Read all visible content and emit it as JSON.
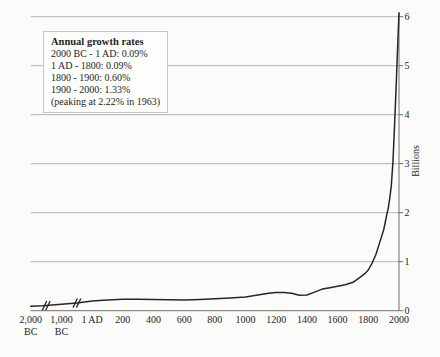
{
  "legend": {
    "title": "Annual growth rates",
    "lines": [
      "2000 BC - 1 AD: 0.09%",
      "1 AD - 1800: 0.09%",
      "1800 - 1900: 0.60%",
      "1900 - 2000: 1.33%",
      "(peaking at 2.22% in 1963)"
    ]
  },
  "chart_data": {
    "type": "line",
    "title": "",
    "xlabel": "",
    "ylabel": "Billions",
    "ylim": [
      0,
      6
    ],
    "y_ticks": [
      0,
      1,
      2,
      3,
      4,
      5,
      6
    ],
    "grid": "horizontal",
    "legend_position": "top-left",
    "x_tick_labels": [
      {
        "top": "2,000",
        "bottom": "BC"
      },
      {
        "top": "1,000",
        "bottom": "BC"
      },
      {
        "top": "1 AD"
      },
      {
        "top": "200"
      },
      {
        "top": "400"
      },
      {
        "top": "600"
      },
      {
        "top": "800"
      },
      {
        "top": "1000"
      },
      {
        "top": "1200"
      },
      {
        "top": "1400"
      },
      {
        "top": "1600"
      },
      {
        "top": "1800"
      },
      {
        "top": "2000"
      }
    ],
    "x_axis_breaks": [
      {
        "after_tick_index": 0,
        "between": [
          "2,000 BC",
          "1,000 BC"
        ]
      },
      {
        "after_tick_index": 1,
        "between": [
          "1,000 BC",
          "1 AD"
        ]
      }
    ],
    "series": [
      {
        "name": "world population",
        "points": [
          [
            -2000,
            0.09
          ],
          [
            -1600,
            0.1
          ],
          [
            -1000,
            0.13
          ],
          [
            -500,
            0.16
          ],
          [
            1,
            0.2
          ],
          [
            100,
            0.22
          ],
          [
            200,
            0.235
          ],
          [
            300,
            0.235
          ],
          [
            400,
            0.23
          ],
          [
            500,
            0.225
          ],
          [
            600,
            0.22
          ],
          [
            700,
            0.23
          ],
          [
            800,
            0.245
          ],
          [
            900,
            0.26
          ],
          [
            1000,
            0.28
          ],
          [
            1100,
            0.33
          ],
          [
            1150,
            0.355
          ],
          [
            1200,
            0.37
          ],
          [
            1250,
            0.37
          ],
          [
            1300,
            0.355
          ],
          [
            1350,
            0.315
          ],
          [
            1400,
            0.32
          ],
          [
            1450,
            0.38
          ],
          [
            1500,
            0.44
          ],
          [
            1550,
            0.47
          ],
          [
            1600,
            0.5
          ],
          [
            1650,
            0.53
          ],
          [
            1700,
            0.58
          ],
          [
            1750,
            0.69
          ],
          [
            1775,
            0.75
          ],
          [
            1800,
            0.83
          ],
          [
            1825,
            0.97
          ],
          [
            1850,
            1.15
          ],
          [
            1875,
            1.4
          ],
          [
            1900,
            1.65
          ],
          [
            1910,
            1.8
          ],
          [
            1920,
            1.95
          ],
          [
            1930,
            2.1
          ],
          [
            1940,
            2.3
          ],
          [
            1950,
            2.55
          ],
          [
            1960,
            3.02
          ],
          [
            1970,
            3.7
          ],
          [
            1980,
            4.45
          ],
          [
            1990,
            5.3
          ],
          [
            2000,
            6.08
          ]
        ]
      }
    ],
    "colors": {
      "curve": "#262626",
      "gridline": "#b2b2b2",
      "axis": "#6e6e6e",
      "background": "#fbfbf9",
      "text": "#1f1f1f"
    }
  }
}
